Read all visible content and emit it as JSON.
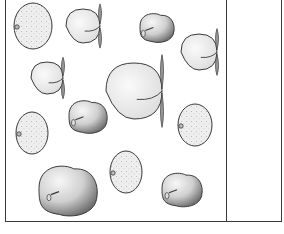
{
  "scene": {
    "description": "Line-art illustration of mixed fruits (oranges, peaches, apples) inside a rectangular frame with an empty right-hand column",
    "colors": {
      "stroke": "#3a3a3a",
      "orange_fill": "#ececec",
      "peach_fill": "#f2f2f2",
      "leaf_fill": "#9a9a9a",
      "apple_light": "#f4f4f4",
      "apple_dark": "#7a7a7a"
    },
    "frame": {
      "left": 5,
      "right": 281,
      "top": 0,
      "bottom": 221,
      "divider_x": 226
    },
    "fruits": [
      {
        "type": "orange",
        "cx": 33,
        "cy": 26,
        "rx": 19,
        "ry": 23
      },
      {
        "type": "peach",
        "cx": 83,
        "cy": 26,
        "r": 17
      },
      {
        "type": "apple",
        "cx": 157,
        "cy": 28,
        "w": 34,
        "h": 30
      },
      {
        "type": "peach",
        "cx": 199,
        "cy": 52,
        "r": 18
      },
      {
        "type": "peach",
        "cx": 47,
        "cy": 78,
        "r": 16
      },
      {
        "type": "peach",
        "cx": 134,
        "cy": 91,
        "r": 28
      },
      {
        "type": "orange",
        "cx": 32,
        "cy": 133,
        "rx": 16,
        "ry": 21
      },
      {
        "type": "apple",
        "cx": 88,
        "cy": 117,
        "w": 38,
        "h": 34
      },
      {
        "type": "orange",
        "cx": 195,
        "cy": 125,
        "rx": 17,
        "ry": 21
      },
      {
        "type": "apple",
        "cx": 68,
        "cy": 191,
        "w": 58,
        "h": 52
      },
      {
        "type": "orange",
        "cx": 126,
        "cy": 172,
        "rx": 16,
        "ry": 21
      },
      {
        "type": "apple",
        "cx": 182,
        "cy": 190,
        "w": 40,
        "h": 35
      }
    ]
  }
}
